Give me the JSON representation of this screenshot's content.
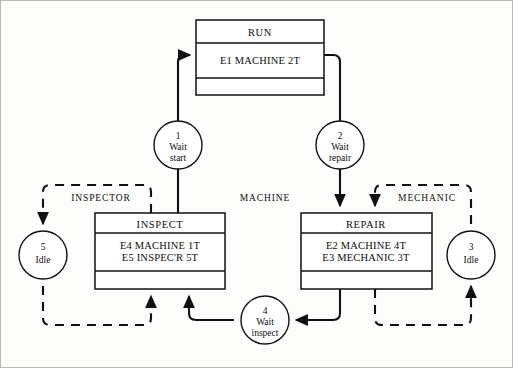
{
  "diagram": {
    "type": "activity-cycle-diagram",
    "width": 513,
    "height": 368,
    "colors": {
      "ink": "#111111",
      "paper": "#fdfdfc",
      "frame": "#b9b9b4"
    },
    "regions": [
      {
        "id": "inspector",
        "label": "INSPECTOR",
        "x": 101,
        "y": 198
      },
      {
        "id": "machine",
        "label": "MACHINE",
        "x": 265,
        "y": 198
      },
      {
        "id": "mechanic",
        "label": "MECHANIC",
        "x": 427,
        "y": 198
      }
    ],
    "activities": [
      {
        "id": "run",
        "title": "RUN",
        "lines": [
          "E1 MACHINE 2T"
        ],
        "x": 196,
        "y": 20,
        "w": 128,
        "h": 75,
        "title_h": 23,
        "body_h": 35
      },
      {
        "id": "inspect",
        "title": "INSPECT",
        "lines": [
          "E4 MACHINE 1T",
          "E5 INSPEC'R  5T"
        ],
        "x": 95,
        "y": 213,
        "w": 130,
        "h": 76,
        "title_h": 20,
        "body_h": 38
      },
      {
        "id": "repair",
        "title": "REPAIR",
        "lines": [
          "E2 MACHINE    4T",
          "E3 MECHANIC 3T"
        ],
        "x": 301,
        "y": 213,
        "w": 131,
        "h": 76,
        "title_h": 20,
        "body_h": 38
      }
    ],
    "queues": [
      {
        "id": "q1",
        "number": "1",
        "lines": [
          "Wait",
          "start"
        ],
        "cx": 178,
        "cy": 145,
        "r": 24
      },
      {
        "id": "q2",
        "number": "2",
        "lines": [
          "Wait",
          "repair"
        ],
        "cx": 340,
        "cy": 145,
        "r": 24
      },
      {
        "id": "q3",
        "number": "3",
        "lines": [
          "Idle"
        ],
        "cx": 471,
        "cy": 255,
        "r": 24
      },
      {
        "id": "q4",
        "number": "4",
        "lines": [
          "Wait",
          "inspect"
        ],
        "cx": 265,
        "cy": 320,
        "r": 24
      },
      {
        "id": "q5",
        "number": "5",
        "lines": [
          "Idle"
        ],
        "cx": 43,
        "cy": 255,
        "r": 24
      }
    ],
    "edges": [
      {
        "id": "edge-q1-to-run",
        "from": "q1",
        "to": "run",
        "style": "solid"
      },
      {
        "id": "edge-run-to-q2",
        "from": "run",
        "to": "q2",
        "style": "solid"
      },
      {
        "id": "edge-q2-to-repair",
        "from": "q2",
        "to": "repair",
        "style": "solid"
      },
      {
        "id": "edge-repair-to-q4",
        "from": "repair",
        "to": "q4",
        "style": "solid"
      },
      {
        "id": "edge-q4-to-inspect",
        "from": "q4",
        "to": "inspect",
        "style": "solid"
      },
      {
        "id": "edge-inspect-to-q1",
        "from": "inspect",
        "to": "q1",
        "style": "solid"
      },
      {
        "id": "edge-inspect-to-q5",
        "from": "inspect",
        "to": "q5",
        "style": "dashed"
      },
      {
        "id": "edge-q5-to-inspect",
        "from": "q5",
        "to": "inspect",
        "style": "dashed"
      },
      {
        "id": "edge-repair-to-q3",
        "from": "repair",
        "to": "q3",
        "style": "dashed"
      },
      {
        "id": "edge-q3-to-repair",
        "from": "q3",
        "to": "repair",
        "style": "dashed"
      }
    ]
  }
}
